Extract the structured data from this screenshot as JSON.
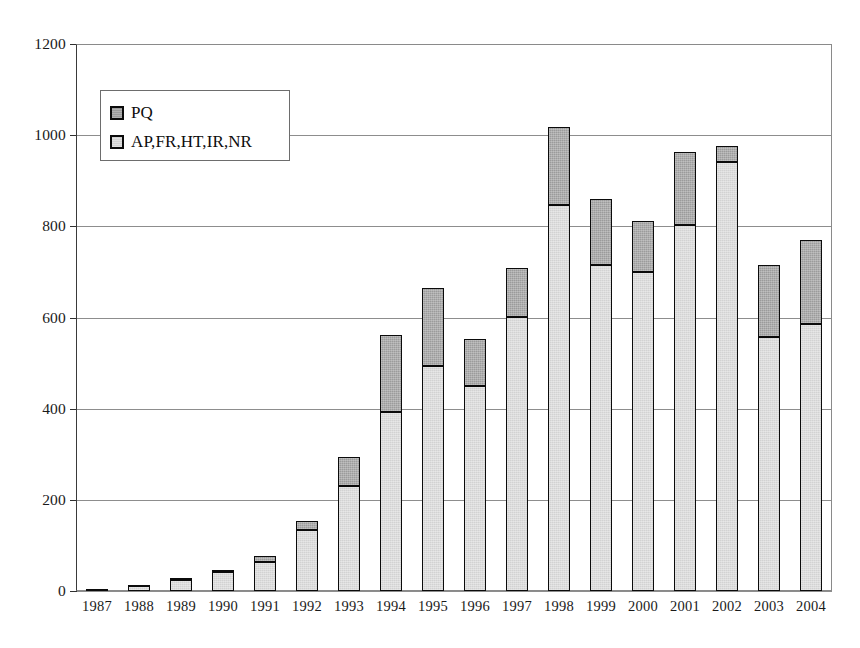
{
  "chart_data": {
    "type": "bar",
    "stacked": true,
    "title": "",
    "subtitle": "",
    "xlabel": "",
    "ylabel": "",
    "ylim": [
      0,
      1200
    ],
    "yticks": [
      0,
      200,
      400,
      600,
      800,
      1000,
      1200
    ],
    "ytick_labels": [
      "0",
      "200",
      "400",
      "600",
      "800",
      "1000",
      "1200"
    ],
    "grid": "horizontal",
    "legend_position": "upper-left-inside",
    "categories": [
      "1987",
      "1988",
      "1989",
      "1990",
      "1991",
      "1992",
      "1993",
      "1994",
      "1995",
      "1996",
      "1997",
      "1998",
      "1999",
      "2000",
      "2001",
      "2002",
      "2003",
      "2004"
    ],
    "series": [
      {
        "name": "AP,FR,HT,IR,NR",
        "order": "bottom",
        "color": "#d2d2d2",
        "values": [
          4,
          11,
          25,
          42,
          63,
          133,
          231,
          393,
          494,
          450,
          600,
          847,
          715,
          700,
          802,
          941,
          557,
          585
        ]
      },
      {
        "name": "PQ",
        "order": "top",
        "color": "#9b9b9b",
        "values": [
          1,
          3,
          3,
          4,
          13,
          20,
          63,
          168,
          170,
          103,
          108,
          170,
          145,
          111,
          161,
          35,
          159,
          186
        ]
      }
    ],
    "totals": [
      5,
      14,
      28,
      46,
      76,
      153,
      294,
      561,
      664,
      553,
      708,
      1017,
      860,
      811,
      963,
      976,
      716,
      771
    ]
  },
  "legend": {
    "entries": [
      {
        "label": "PQ",
        "swatch": "dark-gray-swatch-icon"
      },
      {
        "label": "AP,FR,HT,IR,NR",
        "swatch": "light-gray-swatch-icon"
      }
    ]
  }
}
